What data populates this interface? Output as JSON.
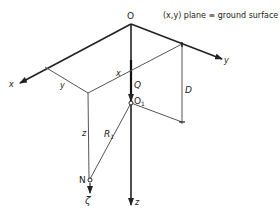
{
  "title": "(x,y) plane ≡ ground surface",
  "labels": {
    "origin": "O",
    "x_axis": "x",
    "y_axis": "y",
    "z_axis": "z",
    "x_dist": "x",
    "y_dist": "y",
    "z_dist": "z",
    "depth": "D",
    "source_point": "O",
    "source_point_sub": "1",
    "force": "Q",
    "radius": "R",
    "radius_sub": "1",
    "point": "N",
    "displacement": "ζ"
  },
  "colors": {
    "line": "#333333",
    "background": "#ffffff"
  }
}
